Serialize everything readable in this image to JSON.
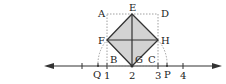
{
  "diagram": {
    "type": "geometry-number-line",
    "number_line": {
      "ticks": [
        "1",
        "2",
        "3",
        "4"
      ],
      "arrows": "both"
    },
    "points": {
      "A": "A",
      "B": "B",
      "C": "C",
      "D": "D",
      "E": "E",
      "F": "F",
      "G": "G",
      "H": "H",
      "P": "P",
      "Q": "Q"
    },
    "colors": {
      "fill": "#d3d3d3",
      "stroke": "#333333",
      "dotted": "#888888"
    }
  }
}
